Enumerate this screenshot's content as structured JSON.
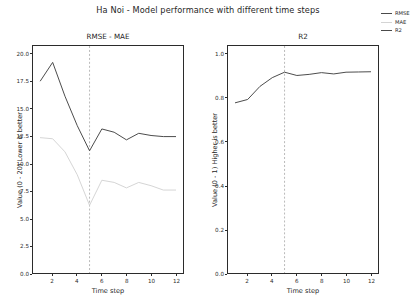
{
  "figure": {
    "title": "Ha Noi - Model performance with different time steps",
    "background": "#ffffff"
  },
  "legend": {
    "position": "upper right outside",
    "items": [
      {
        "label": "RMSE",
        "color": "#4a4a4a"
      },
      {
        "label": "MAE",
        "color": "#d4d4d4"
      },
      {
        "label": "R2",
        "color": "#4a4a4a"
      }
    ]
  },
  "panels": {
    "left": {
      "title": "RMSE - MAE",
      "xlabel": "Time step",
      "ylabel": "Value (0 - 20) Lower is better",
      "yticks": [
        "0.0",
        "2.5",
        "5.0",
        "7.5",
        "10.0",
        "12.5",
        "15.0",
        "17.5",
        "20.0"
      ],
      "xticks": [
        "2",
        "4",
        "6",
        "8",
        "10",
        "12"
      ]
    },
    "right": {
      "title": "R2",
      "xlabel": "Time step",
      "ylabel": "Value (0 - 1) Higher is better",
      "yticks": [
        "0.0",
        "0.2",
        "0.4",
        "0.6",
        "0.8",
        "1.0"
      ],
      "xticks": [
        "2",
        "4",
        "6",
        "8",
        "10",
        "12"
      ]
    }
  },
  "chart_data": [
    {
      "type": "line",
      "title": "RMSE - MAE",
      "xlabel": "Time step",
      "ylabel": "Value (0 - 20) Lower is better",
      "x": [
        1,
        2,
        3,
        4,
        5,
        6,
        7,
        8,
        9,
        10,
        11,
        12
      ],
      "xlim": [
        0.4,
        12.6
      ],
      "ylim": [
        0.0,
        20.8
      ],
      "grid": false,
      "annotations": [
        {
          "type": "vline",
          "x": 5,
          "style": "dashed",
          "color": "#9a9a9a"
        }
      ],
      "series": [
        {
          "name": "RMSE",
          "color": "#4a4a4a",
          "values": [
            17.6,
            19.3,
            16.2,
            13.5,
            11.2,
            13.2,
            12.9,
            12.2,
            12.8,
            12.6,
            12.5,
            12.5
          ]
        },
        {
          "name": "MAE",
          "color": "#d4d4d4",
          "values": [
            12.4,
            12.3,
            11.1,
            9.0,
            6.2,
            8.5,
            8.3,
            7.8,
            8.3,
            8.0,
            7.6,
            7.6
          ]
        }
      ]
    },
    {
      "type": "line",
      "title": "R2",
      "xlabel": "Time step",
      "ylabel": "Value (0 - 1) Higher is better",
      "x": [
        1,
        2,
        3,
        4,
        5,
        6,
        7,
        8,
        9,
        10,
        11,
        12
      ],
      "xlim": [
        0.4,
        12.6
      ],
      "ylim": [
        0.0,
        1.04
      ],
      "grid": false,
      "annotations": [
        {
          "type": "vline",
          "x": 5,
          "style": "dashed",
          "color": "#9a9a9a"
        }
      ],
      "series": [
        {
          "name": "R2",
          "color": "#4a4a4a",
          "values": [
            0.78,
            0.795,
            0.855,
            0.895,
            0.92,
            0.905,
            0.91,
            0.918,
            0.912,
            0.92,
            0.921,
            0.922
          ]
        }
      ]
    }
  ]
}
